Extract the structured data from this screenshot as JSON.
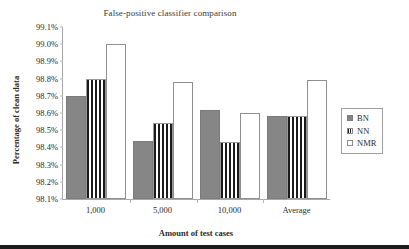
{
  "chart_data": {
    "type": "bar",
    "title": "False-positive classifier comparison",
    "xlabel": "Amount of test cases",
    "ylabel": "Percentage of clean data",
    "categories": [
      "1,000",
      "5,000",
      "10,000",
      "Average"
    ],
    "series": [
      {
        "name": "BN",
        "values": [
          98.7,
          98.44,
          98.62,
          98.585
        ]
      },
      {
        "name": "NN",
        "values": [
          98.8,
          98.54,
          98.43,
          98.585
        ]
      },
      {
        "name": "NMR",
        "values": [
          99.0,
          98.78,
          98.6,
          98.79
        ]
      }
    ],
    "ylim": [
      98.1,
      99.1
    ],
    "ytick_values": [
      99.1,
      99.0,
      98.9,
      98.8,
      98.7,
      98.6,
      98.5,
      98.4,
      98.3,
      98.2,
      98.1
    ],
    "ytick_labels": [
      "99.1%",
      "99.0%",
      "98.9%",
      "98.8%",
      "98.7%",
      "98.6%",
      "98.5%",
      "98.4%",
      "98.3%",
      "98.2%",
      "98.1%"
    ],
    "grid": false,
    "legend_position": "right",
    "colors": {
      "bn_fill": "#868686",
      "nn_fill": "#ffffff",
      "nn_stripe": "#1a1a1a",
      "nmr_fill": "#ffffff",
      "axis": "#a8a8a8",
      "text": "#2b2b2b"
    }
  },
  "legend": {
    "items": [
      {
        "label": "BN"
      },
      {
        "label": "NN"
      },
      {
        "label": "NMR"
      }
    ]
  }
}
